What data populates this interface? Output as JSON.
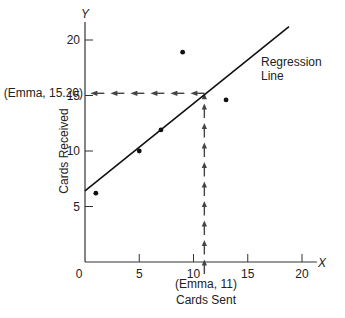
{
  "chart_data": {
    "type": "scatter",
    "title": "",
    "xlabel": "Cards Sent",
    "ylabel": "Cards Received",
    "x_axis_letter": "X",
    "y_axis_letter": "Y",
    "xlim": [
      0,
      21
    ],
    "ylim": [
      0,
      21
    ],
    "xticks": [
      0,
      5,
      10,
      15,
      20
    ],
    "yticks": [
      5,
      10,
      15,
      20
    ],
    "grid": false,
    "legend": null,
    "series": [
      {
        "name": "Observations",
        "points": [
          {
            "x": 1,
            "y": 6.2
          },
          {
            "x": 5,
            "y": 10
          },
          {
            "x": 7,
            "y": 11.9
          },
          {
            "x": 9,
            "y": 18.9
          },
          {
            "x": 13,
            "y": 14.6
          }
        ]
      }
    ],
    "regression_line": {
      "label": "Regression Line",
      "label_line1": "Regression",
      "label_line2": "Line",
      "start": {
        "x": 0,
        "y": 6.4
      },
      "end": {
        "x": 18.8,
        "y": 21.2
      }
    },
    "annotations": {
      "emma_x": {
        "label": "(Emma, 11)",
        "x": 11
      },
      "emma_y": {
        "label": "(Emma, 15.20)",
        "y": 15.2
      }
    }
  },
  "colors": {
    "axis": "#333333",
    "line": "#111111",
    "point": "#111111",
    "dashed": "#444444",
    "text": "#222222"
  }
}
